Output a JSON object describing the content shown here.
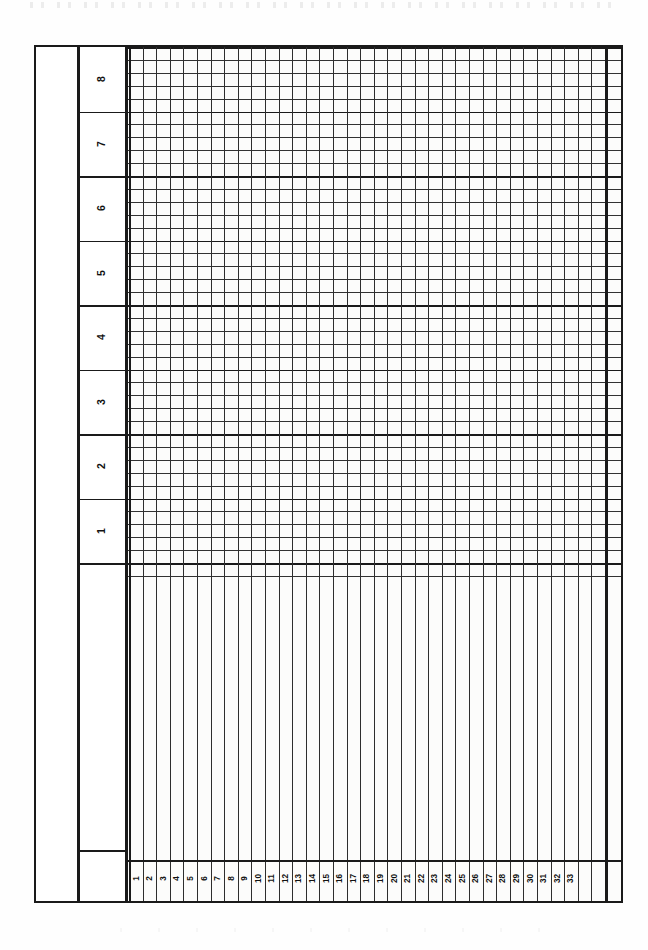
{
  "document": {
    "kind": "blank-ruled-tally-form",
    "orientation": "portrait",
    "background_color": "#ffffff",
    "ink_color": "#1a1a1a"
  },
  "table": {
    "frame": {
      "left": 34,
      "top": 45,
      "right": 623,
      "bottom": 903,
      "border_width": 2.6
    },
    "stub_column": {
      "label": "",
      "divider_x": 75
    },
    "band_label_column": {
      "divider_x": 123,
      "labels": [
        "8",
        "7",
        "6",
        "5",
        "4",
        "3",
        "2",
        "1"
      ],
      "rotation_degrees": -90,
      "sub_rows_per_band": 5,
      "band_height": 64.5,
      "lower_divider_y": 848
    },
    "grid": {
      "start_x": 127,
      "end_x": 623,
      "ruled_bottom_y": 563,
      "column_count": 35,
      "column_width": 13.6,
      "heavy_column_divider_x": 603,
      "sub_row_height": 12.9
    },
    "column_numbers": {
      "values": [
        "1",
        "2",
        "3",
        "4",
        "5",
        "6",
        "7",
        "8",
        "9",
        "10",
        "11",
        "12",
        "13",
        "14",
        "15",
        "16",
        "17",
        "18",
        "19",
        "20",
        "21",
        "22",
        "23",
        "24",
        "25",
        "26",
        "27",
        "28",
        "29",
        "30",
        "31",
        "32",
        "33"
      ],
      "unnumbered_trailing_columns": 2,
      "rotation_degrees": -90,
      "strip_top_y": 858
    },
    "open_writing_area": {
      "top_y": 563,
      "bottom_y": 858,
      "has_horizontal_rules": false,
      "has_vertical_rules": true
    }
  },
  "colors": {
    "ink": "#1a1a1a",
    "rule_thin": "#323232",
    "paper": "#ffffff",
    "paper_tint": "#fafaf8"
  }
}
